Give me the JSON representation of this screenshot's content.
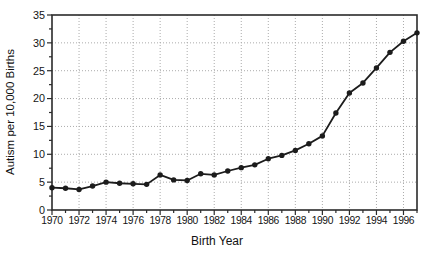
{
  "chart_data": {
    "type": "line",
    "title": "",
    "xlabel": "Birth Year",
    "ylabel": "Autism per 10,000 Births",
    "x": [
      1970,
      1971,
      1972,
      1973,
      1974,
      1975,
      1976,
      1977,
      1978,
      1979,
      1980,
      1981,
      1982,
      1983,
      1984,
      1985,
      1986,
      1987,
      1988,
      1989,
      1990,
      1991,
      1992,
      1993,
      1994,
      1995,
      1996,
      1997
    ],
    "values": [
      4.0,
      3.9,
      3.7,
      4.3,
      5.0,
      4.8,
      4.7,
      4.6,
      6.3,
      5.4,
      5.3,
      6.5,
      6.3,
      7.0,
      7.6,
      8.1,
      9.2,
      9.8,
      10.7,
      11.9,
      13.3,
      17.4,
      21.0,
      22.8,
      25.5,
      28.3,
      30.3,
      31.8
    ],
    "series_name": "Autism rate per 10,000 births",
    "xlim": [
      1970,
      1997
    ],
    "ylim": [
      0,
      35
    ],
    "x_major_ticks": [
      1970,
      1972,
      1974,
      1976,
      1978,
      1980,
      1982,
      1984,
      1986,
      1988,
      1990,
      1992,
      1994,
      1996
    ],
    "x_minor_step": 1,
    "y_major_ticks": [
      0,
      5,
      10,
      15,
      20,
      25,
      30,
      35
    ],
    "y_minor_step": 2.5,
    "grid": "dotted gridlines at major ticks",
    "legend": "none",
    "marker": "filled-circle",
    "line_color": "#1c1c1c",
    "marker_color": "#1c1c1c",
    "grid_color": "#ababab",
    "frame_color": "#2b2b2b",
    "background_color": "#ffffff"
  }
}
